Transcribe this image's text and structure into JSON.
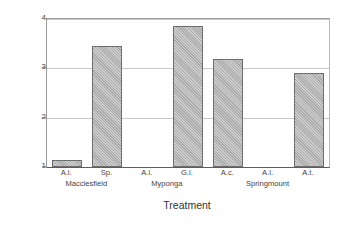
{
  "chart_data": {
    "type": "bar",
    "title": "",
    "xlabel": "Treatment",
    "ylabel": "Dung Left on Surface (Mean Rank)",
    "ylim": [
      1,
      4
    ],
    "yticks": [
      "1",
      "2",
      "3",
      "4"
    ],
    "ytick_values": [
      1,
      2,
      3,
      4
    ],
    "gridlines": [
      2,
      3,
      4
    ],
    "grid": true,
    "legend": "none",
    "baseline": 1,
    "categories": [
      "A.l.",
      "Sp.",
      "A.l.",
      "G.l.",
      "A.c.",
      "A.l.",
      "A.t."
    ],
    "values": [
      1.15,
      3.45,
      1.0,
      3.86,
      3.18,
      1.0,
      2.9
    ],
    "groups": [
      {
        "label": "Macclesfield",
        "categories": [
          "A.l.",
          "Sp."
        ],
        "values": [
          1.15,
          3.45
        ]
      },
      {
        "label": "Myponga",
        "categories": [
          "A.l.",
          "G.l."
        ],
        "values": [
          1.0,
          3.86
        ]
      },
      {
        "label": "Springmount",
        "categories": [
          "A.c.",
          "A.l.",
          "A.t."
        ],
        "values": [
          3.18,
          1.0,
          2.9
        ]
      }
    ],
    "bar_color": "#b4b4b4",
    "bar_edge_color": "#6e6e6e",
    "grid_color": "#c8c8c8",
    "axis_color": "#5d5d5d"
  }
}
